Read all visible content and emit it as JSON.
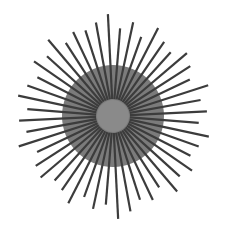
{
  "figure": {
    "center": [
      113,
      116
    ],
    "disk": {
      "radius": 51,
      "color": "#7b7b7b"
    },
    "inner_circle": {
      "radius": 16,
      "color": "#8a8a8a"
    },
    "lines": {
      "count": 48,
      "color": "#3c3c3c",
      "width": 2.2,
      "inner_radius": 17,
      "lengths": [
        102,
        88,
        96,
        84,
        99,
        90,
        86,
        97,
        92,
        85,
        100,
        89,
        94,
        86,
        98,
        91,
        87,
        96,
        90,
        99,
        85,
        93,
        88,
        97,
        103,
        89,
        95,
        86,
        98,
        90,
        87,
        95,
        92,
        84,
        99,
        88,
        94,
        86,
        97,
        91,
        85,
        96,
        89,
        100,
        87,
        93,
        90,
        95
      ]
    },
    "background": "#ffffff"
  }
}
